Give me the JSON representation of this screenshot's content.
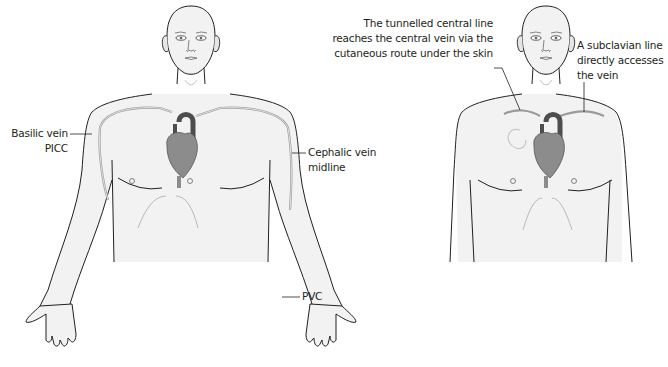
{
  "figure": {
    "left_panel": {
      "title": "Peripheral venous access routes",
      "labels": {
        "basilic": [
          "Basilic vein",
          "PICC"
        ],
        "cephalic": [
          "Cephalic vein",
          "midline"
        ],
        "pvc": "PVC"
      }
    },
    "right_panel": {
      "labels": {
        "tunnelled": [
          "The tunnelled central line",
          "reaches the central vein via the",
          "cutaneous route under the skin"
        ],
        "subclavian": [
          "A subclavian line",
          "directly accesses",
          "the vein"
        ]
      }
    }
  },
  "colors": {
    "skin_fill": "#f2f2f2",
    "outline": "#231f20",
    "heart": "#8c8c8c",
    "heart_dark": "#4d4d4d",
    "vein": "#9a9a9a",
    "text": "#231f20"
  }
}
